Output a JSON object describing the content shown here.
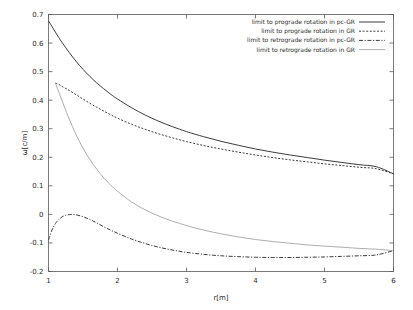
{
  "chart_data": {
    "type": "line",
    "title": "",
    "xlabel": "r[m]",
    "ylabel": "ω[c/m]",
    "xlim": [
      1,
      6
    ],
    "ylim": [
      -0.2,
      0.7
    ],
    "xticks": [
      1,
      2,
      3,
      4,
      5,
      6
    ],
    "xtick_labels": [
      "1",
      "2",
      "3",
      "4",
      "5",
      "6"
    ],
    "yticks": [
      -0.2,
      -0.1,
      0,
      0.1,
      0.2,
      0.3,
      0.4,
      0.5,
      0.6,
      0.7
    ],
    "ytick_labels": [
      "-0.2",
      "-0.1",
      "0",
      "0.1",
      "0.2",
      "0.3",
      "0.4",
      "0.5",
      "0.6",
      "0.7"
    ],
    "grid": false,
    "legend_position": "top-right",
    "series": [
      {
        "name": "limit to prograde rotation in pc-GR",
        "style": "solid",
        "color": "#3c3c3c",
        "width": 1.0,
        "x": [
          1.0,
          1.05,
          1.1,
          1.15,
          1.2,
          1.3,
          1.4,
          1.5,
          1.6,
          1.7,
          1.8,
          1.9,
          2.0,
          2.2,
          2.4,
          2.6,
          2.8,
          3.0,
          3.25,
          3.5,
          3.75,
          4.0,
          4.25,
          4.5,
          4.75,
          5.0,
          5.25,
          5.5,
          5.75,
          6.0
        ],
        "y": [
          0.678,
          0.658,
          0.638,
          0.619,
          0.601,
          0.567,
          0.536,
          0.508,
          0.483,
          0.46,
          0.44,
          0.421,
          0.404,
          0.374,
          0.348,
          0.326,
          0.307,
          0.29,
          0.272,
          0.256,
          0.242,
          0.229,
          0.218,
          0.208,
          0.199,
          0.19,
          0.182,
          0.174,
          0.167,
          0.142
        ]
      },
      {
        "name": "limit to prograde rotation in GR",
        "style": "dotted",
        "color": "#3c3c3c",
        "width": 1.0,
        "x": [
          1.1,
          1.15,
          1.2,
          1.3,
          1.4,
          1.5,
          1.6,
          1.7,
          1.8,
          1.9,
          2.0,
          2.2,
          2.4,
          2.6,
          2.8,
          3.0,
          3.25,
          3.5,
          3.75,
          4.0,
          4.25,
          4.5,
          4.75,
          5.0,
          5.25,
          5.5,
          5.75,
          6.0
        ],
        "y": [
          0.46,
          0.455,
          0.448,
          0.434,
          0.419,
          0.404,
          0.389,
          0.375,
          0.362,
          0.349,
          0.337,
          0.316,
          0.298,
          0.282,
          0.268,
          0.255,
          0.241,
          0.229,
          0.218,
          0.208,
          0.199,
          0.191,
          0.184,
          0.177,
          0.171,
          0.165,
          0.16,
          0.142
        ]
      },
      {
        "name": "limit to retrograde rotation in pc-GR",
        "style": "dashdot",
        "color": "#3c3c3c",
        "width": 1.0,
        "x": [
          1.0,
          1.05,
          1.1,
          1.15,
          1.2,
          1.25,
          1.3,
          1.35,
          1.4,
          1.5,
          1.6,
          1.7,
          1.8,
          1.9,
          2.0,
          2.2,
          2.4,
          2.6,
          2.8,
          3.0,
          3.25,
          3.5,
          3.75,
          4.0,
          4.25,
          4.5,
          4.75,
          5.0,
          5.25,
          5.5,
          5.75,
          6.0
        ],
        "y": [
          -0.09,
          -0.055,
          -0.032,
          -0.018,
          -0.008,
          -0.003,
          -0.0008,
          0.0,
          -0.0015,
          -0.008,
          -0.018,
          -0.03,
          -0.043,
          -0.055,
          -0.066,
          -0.086,
          -0.102,
          -0.115,
          -0.125,
          -0.133,
          -0.14,
          -0.145,
          -0.148,
          -0.15,
          -0.151,
          -0.151,
          -0.15,
          -0.149,
          -0.147,
          -0.145,
          -0.142,
          -0.127
        ]
      },
      {
        "name": "limit to retrograde rotation in GR",
        "style": "solid-thin",
        "color": "#8a8a8a",
        "width": 0.7,
        "x": [
          1.1,
          1.15,
          1.2,
          1.25,
          1.3,
          1.4,
          1.5,
          1.6,
          1.7,
          1.8,
          1.9,
          2.0,
          2.2,
          2.4,
          2.6,
          2.8,
          3.0,
          3.25,
          3.5,
          3.75,
          4.0,
          4.25,
          4.5,
          4.75,
          5.0,
          5.25,
          5.5,
          5.75,
          6.0
        ],
        "y": [
          0.46,
          0.428,
          0.396,
          0.364,
          0.334,
          0.279,
          0.232,
          0.192,
          0.158,
          0.128,
          0.103,
          0.081,
          0.044,
          0.016,
          -0.006,
          -0.024,
          -0.039,
          -0.055,
          -0.068,
          -0.079,
          -0.088,
          -0.095,
          -0.101,
          -0.107,
          -0.111,
          -0.115,
          -0.119,
          -0.122,
          -0.127
        ]
      }
    ]
  },
  "legend": {
    "entries": [
      {
        "label": "limit to prograde rotation in pc-GR"
      },
      {
        "label": "limit to prograde rotation in GR"
      },
      {
        "label": "limit to retrograde rotation in pc-GR"
      },
      {
        "label": "limit to retrograde rotation in GR"
      }
    ]
  },
  "colors": {
    "axis": "#5a5a5a",
    "text": "#2b2b2b",
    "curve_dark": "#3c3c3c",
    "curve_light": "#8a8a8a",
    "background": "#ffffff"
  }
}
